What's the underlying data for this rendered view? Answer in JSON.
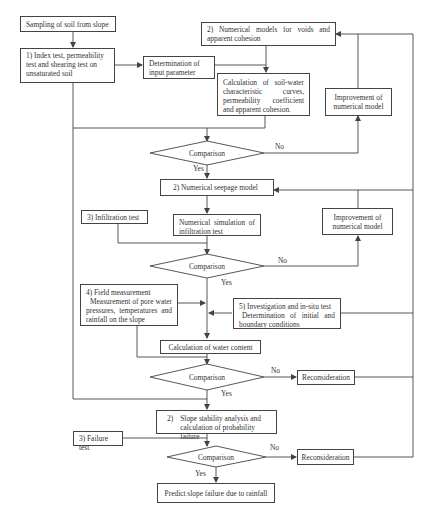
{
  "diagram": {
    "type": "flowchart",
    "nodes": {
      "sampling": "Sampling of soil from slope",
      "index_test": "1) Index test, permeability test and shearing test on unsaturated soil",
      "determination_input": "Determination of input parameter",
      "numerical_models_voids": "2) Numerical models for voids and apparent cohesion",
      "calc_swcc": "Calculation of soil-water characteristic curves, permeability coefficient and apparent cohesion.",
      "improvement_1": "Improvement of numerical model",
      "comparison_1": "Comparison",
      "numerical_seepage": "2) Numerical seepage model",
      "infiltration_test": "3) Infiltration test",
      "numerical_simulation": "Numerical simulation of infiltration test",
      "improvement_2": "Improvement of numerical model",
      "comparison_2": "Comparison",
      "field_measurement_title": "4) Field measurement",
      "field_measurement_body": "Measurement of pore water pressures, temperatures and rainfall on the slope",
      "investigation_title": "5) Investigation and in-situ test",
      "investigation_body": "Determination of initial and boundary conditions",
      "calc_water_content": "Calculation of water content",
      "comparison_3": "Comparison",
      "reconsideration_1": "Reconsideration",
      "slope_stability_num": "2)",
      "slope_stability_line1": "Slope stability analysis and",
      "slope_stability_line2": "calculation of probability failure",
      "failure_test": "3) Failure test",
      "comparison_4": "Comparison",
      "reconsideration_2": "Reconsideration",
      "predict": "Predict slope failure due to rainfall"
    },
    "edge_labels": {
      "yes": "Yes",
      "no": "No"
    },
    "colors": {
      "stroke": "#444444",
      "text": "#333333",
      "background": "#ffffff"
    }
  }
}
